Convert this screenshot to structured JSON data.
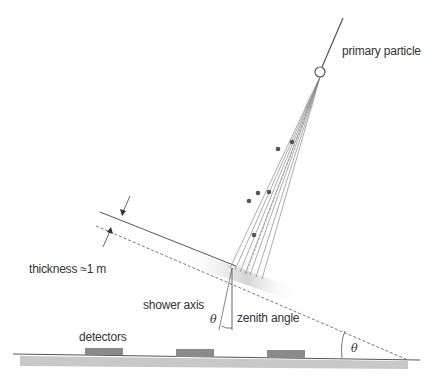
{
  "diagram": {
    "type": "air shower geometry",
    "labels": {
      "primary_particle": "primary particle",
      "thickness": "thickness ≈1 m",
      "shower_axis": "shower axis",
      "zenith_angle": "zenith angle",
      "theta_symbol": "θ",
      "theta_ground": "θ",
      "detectors": "detectors"
    },
    "detectors_count": 3,
    "colors": {
      "line": "#555555",
      "dots": "#555555",
      "detector": "#8a8a8a",
      "ground": "#c8c8c8",
      "shower_front_shade": "#d6d6d6"
    }
  }
}
